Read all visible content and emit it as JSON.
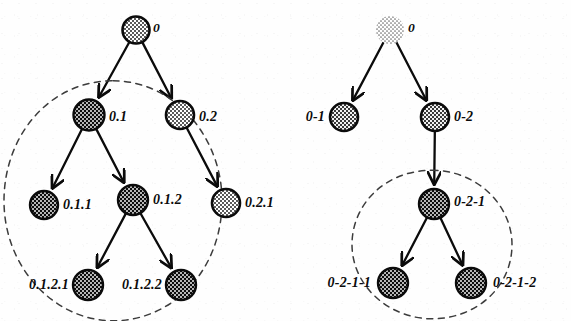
{
  "figure": {
    "title": "",
    "type": "diagram",
    "background_color": "#ffffff",
    "ink_color": "#0b0b0b",
    "trees": [
      {
        "id": "left-tree",
        "notation": "dot",
        "nodes": [
          {
            "id": "l0",
            "label": "0",
            "cx": 136,
            "cy": 30,
            "r": 13.5,
            "fill": "light",
            "label_dx": 17,
            "label_dy": -2,
            "label_anchor": "start",
            "size": "sm"
          },
          {
            "id": "l01",
            "label": "0.1",
            "cx": 89,
            "cy": 115,
            "r": 15.5,
            "fill": "dark",
            "label_dx": 20,
            "label_dy": 2,
            "label_anchor": "start",
            "size": "md"
          },
          {
            "id": "l02",
            "label": "0.2",
            "cx": 180,
            "cy": 115,
            "r": 14,
            "fill": "light",
            "label_dx": 19,
            "label_dy": 2,
            "label_anchor": "start",
            "size": "md"
          },
          {
            "id": "l011",
            "label": "0.1.1",
            "cx": 44,
            "cy": 205,
            "r": 14,
            "fill": "dark",
            "label_dx": 19,
            "label_dy": 0,
            "label_anchor": "start",
            "size": "md"
          },
          {
            "id": "l012",
            "label": "0.1.2",
            "cx": 133,
            "cy": 200,
            "r": 15,
            "fill": "dark",
            "label_dx": 20,
            "label_dy": 0,
            "label_anchor": "start",
            "size": "md"
          },
          {
            "id": "l021",
            "label": "0.2.1",
            "cx": 226,
            "cy": 203,
            "r": 14,
            "fill": "light",
            "label_dx": 19,
            "label_dy": 0,
            "label_anchor": "start",
            "size": "md"
          },
          {
            "id": "l0121",
            "label": "0.1.2.1",
            "cx": 88,
            "cy": 285,
            "r": 15,
            "fill": "dark",
            "label_dx": -19,
            "label_dy": 0,
            "label_anchor": "end",
            "size": "md"
          },
          {
            "id": "l0122",
            "label": "0.1.2.2",
            "cx": 181,
            "cy": 285,
            "r": 15,
            "fill": "dark",
            "label_dx": -19,
            "label_dy": 0,
            "label_anchor": "end",
            "size": "md"
          }
        ],
        "edges": [
          {
            "from": "l0",
            "to": "l01"
          },
          {
            "from": "l0",
            "to": "l02"
          },
          {
            "from": "l01",
            "to": "l011"
          },
          {
            "from": "l01",
            "to": "l012"
          },
          {
            "from": "l02",
            "to": "l021"
          },
          {
            "from": "l012",
            "to": "l0121"
          },
          {
            "from": "l012",
            "to": "l0122"
          }
        ],
        "enclosure": {
          "id": "left-enclosure",
          "encloses": [
            "0.1",
            "0.1.1",
            "0.1.2",
            "0.1.2.1",
            "0.1.2.2"
          ],
          "style": "dashed"
        }
      },
      {
        "id": "right-tree",
        "notation": "dash",
        "nodes": [
          {
            "id": "r0",
            "label": "0",
            "cx": 390,
            "cy": 30,
            "r": 14,
            "fill": "faint",
            "label_dx": 18,
            "label_dy": -2,
            "label_anchor": "start",
            "size": "sm"
          },
          {
            "id": "r01",
            "label": "0-1",
            "cx": 344,
            "cy": 117,
            "r": 14,
            "fill": "mid",
            "label_dx": -19,
            "label_dy": 0,
            "label_anchor": "end",
            "size": "md"
          },
          {
            "id": "r02",
            "label": "0-2",
            "cx": 435,
            "cy": 117,
            "r": 14,
            "fill": "mid",
            "label_dx": 19,
            "label_dy": 0,
            "label_anchor": "start",
            "size": "md"
          },
          {
            "id": "r021",
            "label": "0-2-1",
            "cx": 434,
            "cy": 204,
            "r": 15,
            "fill": "dark",
            "label_dx": 20,
            "label_dy": -2,
            "label_anchor": "start",
            "size": "md"
          },
          {
            "id": "r0211",
            "label": "0-2-1-1",
            "cx": 393,
            "cy": 283,
            "r": 15,
            "fill": "dark",
            "label_dx": -22,
            "label_dy": 0,
            "label_anchor": "end",
            "size": "md"
          },
          {
            "id": "r0212",
            "label": "0-2-1-2",
            "cx": 471,
            "cy": 283,
            "r": 15,
            "fill": "dark",
            "label_dx": 22,
            "label_dy": 0,
            "label_anchor": "start",
            "size": "md"
          }
        ],
        "edges": [
          {
            "from": "r0",
            "to": "r01"
          },
          {
            "from": "r0",
            "to": "r02"
          },
          {
            "from": "r02",
            "to": "r021"
          },
          {
            "from": "r021",
            "to": "r0211"
          },
          {
            "from": "r021",
            "to": "r0212"
          }
        ],
        "enclosure": {
          "id": "right-enclosure",
          "encloses": [
            "0-2-1",
            "0-2-1-1",
            "0-2-1-2"
          ],
          "style": "dashed"
        }
      }
    ]
  }
}
